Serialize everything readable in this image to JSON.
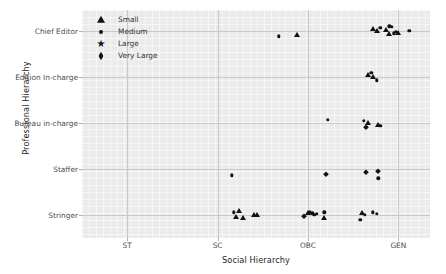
{
  "chart_data": {
    "type": "scatter",
    "title": "",
    "xlabel": "Social Hierarchy",
    "ylabel": "Professional Hierarchy",
    "x_categories": [
      "ST",
      "SC",
      "OBC",
      "GEN"
    ],
    "y_categories": [
      "Stringer",
      "Staffer",
      "Bureau in-charge",
      "Edition In-charge",
      "Chief Editor"
    ],
    "grid": true,
    "legend": {
      "position": "upper-left-inside",
      "title": "",
      "entries": [
        {
          "label": "Small",
          "marker": "triangle"
        },
        {
          "label": "Medium",
          "marker": "circle"
        },
        {
          "label": "Large",
          "marker": "star"
        },
        {
          "label": "Very Large",
          "marker": "diamond"
        }
      ]
    },
    "points": [
      {
        "x": 2.68,
        "y": 4.88,
        "size": "medium"
      },
      {
        "x": 2.88,
        "y": 4.9,
        "size": "small"
      },
      {
        "x": 3.72,
        "y": 5.04,
        "size": "small"
      },
      {
        "x": 3.76,
        "y": 5.0,
        "size": "small"
      },
      {
        "x": 3.8,
        "y": 5.06,
        "size": "medium"
      },
      {
        "x": 3.86,
        "y": 5.02,
        "size": "small"
      },
      {
        "x": 3.9,
        "y": 5.1,
        "size": "medium"
      },
      {
        "x": 3.93,
        "y": 5.08,
        "size": "medium"
      },
      {
        "x": 3.9,
        "y": 4.92,
        "size": "small"
      },
      {
        "x": 3.95,
        "y": 4.94,
        "size": "medium"
      },
      {
        "x": 3.97,
        "y": 4.98,
        "size": "medium"
      },
      {
        "x": 4.0,
        "y": 4.96,
        "size": "small"
      },
      {
        "x": 4.12,
        "y": 5.0,
        "size": "medium"
      },
      {
        "x": 3.66,
        "y": 4.04,
        "size": "small"
      },
      {
        "x": 3.7,
        "y": 4.08,
        "size": "medium"
      },
      {
        "x": 3.72,
        "y": 4.0,
        "size": "small"
      },
      {
        "x": 3.76,
        "y": 3.92,
        "size": "medium"
      },
      {
        "x": 3.22,
        "y": 3.06,
        "size": "medium"
      },
      {
        "x": 3.62,
        "y": 3.04,
        "size": "medium"
      },
      {
        "x": 3.66,
        "y": 3.0,
        "size": "small"
      },
      {
        "x": 3.64,
        "y": 2.92,
        "size": "very-large"
      },
      {
        "x": 3.78,
        "y": 2.96,
        "size": "small"
      },
      {
        "x": 3.8,
        "y": 2.94,
        "size": "medium"
      },
      {
        "x": 2.16,
        "y": 1.86,
        "size": "medium"
      },
      {
        "x": 3.2,
        "y": 1.9,
        "size": "very-large"
      },
      {
        "x": 3.64,
        "y": 1.94,
        "size": "very-large"
      },
      {
        "x": 3.78,
        "y": 1.96,
        "size": "very-large"
      },
      {
        "x": 3.78,
        "y": 1.8,
        "size": "medium"
      },
      {
        "x": 2.18,
        "y": 1.06,
        "size": "medium"
      },
      {
        "x": 2.24,
        "y": 1.08,
        "size": "small"
      },
      {
        "x": 2.2,
        "y": 0.96,
        "size": "small"
      },
      {
        "x": 2.28,
        "y": 0.94,
        "size": "small"
      },
      {
        "x": 2.4,
        "y": 1.0,
        "size": "small"
      },
      {
        "x": 2.44,
        "y": 1.0,
        "size": "small"
      },
      {
        "x": 2.96,
        "y": 0.98,
        "size": "very-large"
      },
      {
        "x": 3.0,
        "y": 1.04,
        "size": "small"
      },
      {
        "x": 3.02,
        "y": 1.06,
        "size": "medium"
      },
      {
        "x": 3.05,
        "y": 1.04,
        "size": "medium"
      },
      {
        "x": 3.07,
        "y": 1.0,
        "size": "medium"
      },
      {
        "x": 3.1,
        "y": 1.02,
        "size": "medium"
      },
      {
        "x": 3.18,
        "y": 1.06,
        "size": "medium"
      },
      {
        "x": 3.18,
        "y": 0.94,
        "size": "small"
      },
      {
        "x": 3.6,
        "y": 1.04,
        "size": "small"
      },
      {
        "x": 3.63,
        "y": 1.0,
        "size": "medium"
      },
      {
        "x": 3.72,
        "y": 1.06,
        "size": "medium"
      },
      {
        "x": 3.76,
        "y": 1.02,
        "size": "medium"
      },
      {
        "x": 3.58,
        "y": 0.9,
        "size": "medium"
      }
    ],
    "axis_ranges": {
      "xlim": [
        0.5,
        4.35
      ],
      "ylim": [
        0.5,
        5.45
      ]
    },
    "marker_color": "#121212",
    "panel_color": "#ebebeb",
    "grid_color": "#c9c9c9"
  }
}
